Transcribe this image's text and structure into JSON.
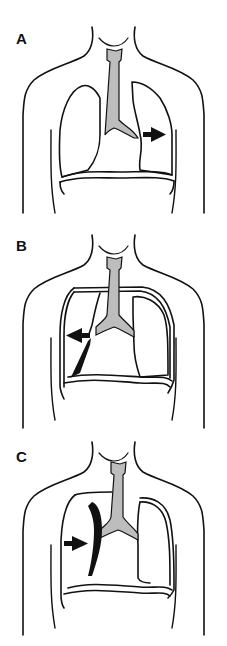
{
  "figure": {
    "panels": [
      {
        "label": "A",
        "description": "Mediastinum shifted; arrow pointing right toward left lung"
      },
      {
        "label": "B",
        "description": "Pleural line on right with dark wedge; arrow pointing left"
      },
      {
        "label": "C",
        "description": "Dark curved band beside trachea; arrow pointing right"
      }
    ],
    "colors": {
      "outline": "#111111",
      "airway_fill": "#bdbdbd",
      "arrow": "#111111",
      "background": "#ffffff"
    }
  }
}
